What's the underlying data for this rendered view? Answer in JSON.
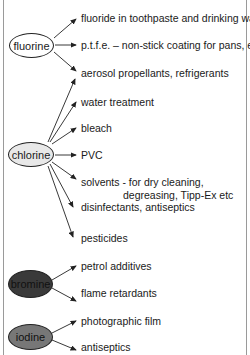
{
  "colors": {
    "fluorine_fill": "#ffffff",
    "chlorine_fill": "#e8e8e8",
    "bromine_fill": "#3a3a3a",
    "iodine_fill": "#777777",
    "line": "#222222",
    "frame": "#9a9a9a"
  },
  "elements": [
    {
      "name": "fluorine",
      "uses": [
        "fluoride in toothpaste and drinking water",
        "p.t.f.e. – non-stick coating for pans, etc.",
        "aerosol propellants, refrigerants"
      ]
    },
    {
      "name": "chlorine",
      "uses": [
        "water treatment",
        "bleach",
        "PVC",
        "solvents - for dry cleaning,",
        "degreasing, Tipp-Ex etc",
        "disinfectants, antiseptics",
        "pesticides"
      ]
    },
    {
      "name": "bromine",
      "uses": [
        "petrol additives",
        "flame retardants"
      ]
    },
    {
      "name": "iodine",
      "uses": [
        "photographic film",
        "antiseptics"
      ]
    }
  ]
}
